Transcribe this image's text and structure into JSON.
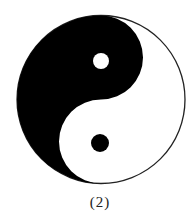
{
  "figure": {
    "name": "yin-yang symbol",
    "colors": {
      "dark": "#000000",
      "light": "#ffffff",
      "outline": "#222222"
    },
    "outer_circle": {
      "cx": 101,
      "cy": 99.5,
      "r": 84.5
    },
    "dark_dot": {
      "cx": 100,
      "cy": 143,
      "r": 9
    },
    "light_dot": {
      "cx": 101,
      "cy": 61,
      "r": 8
    }
  },
  "caption": "(2)"
}
